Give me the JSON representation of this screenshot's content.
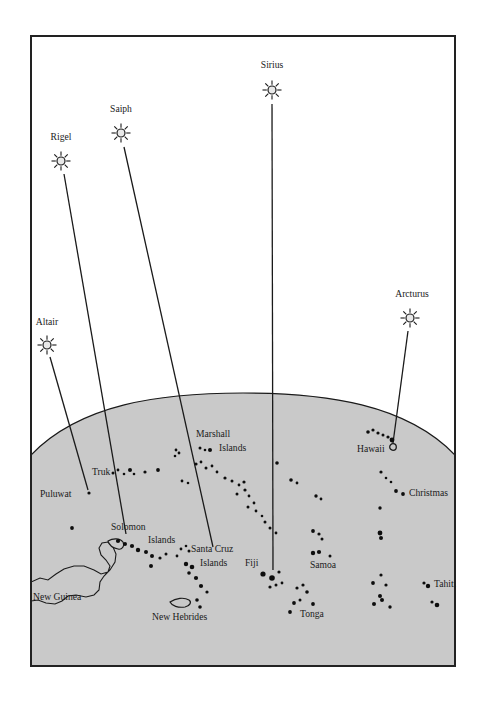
{
  "figure": {
    "frame": {
      "x": 31,
      "y": 36,
      "width": 424,
      "height": 630
    },
    "colors": {
      "ocean": "#c9c9c9",
      "sky": "#ffffff",
      "ink": "#1a1a1a",
      "frame": "#222222",
      "star_fill": "#e8e8e8",
      "page": "#ffffff"
    },
    "horizon": {
      "description": "curved ocean horizon arc",
      "left_y": 455,
      "apex_x": 243,
      "apex_y": 393,
      "right_y": 455
    }
  },
  "stars": [
    {
      "name": "Altair",
      "label": "Altair",
      "star_x": 47,
      "star_y": 345,
      "label_x": 47,
      "label_y": 325,
      "ray_line": {
        "x1": 50,
        "y1": 357,
        "x2": 88,
        "y2": 490
      }
    },
    {
      "name": "Rigel",
      "label": "Rigel",
      "star_x": 61,
      "star_y": 161,
      "label_x": 61,
      "label_y": 140,
      "ray_line": {
        "x1": 64,
        "y1": 174,
        "x2": 126,
        "y2": 534
      }
    },
    {
      "name": "Saipn",
      "label": "Saiph",
      "star_x": 121,
      "star_y": 133,
      "label_x": 121,
      "label_y": 112,
      "ray_line": {
        "x1": 124,
        "y1": 147,
        "x2": 213,
        "y2": 547
      }
    },
    {
      "name": "Sirius",
      "label": "Sirius",
      "star_x": 272,
      "star_y": 90,
      "label_x": 272,
      "label_y": 68,
      "ray_line": {
        "x1": 272,
        "y1": 104,
        "x2": 273,
        "y2": 570
      }
    },
    {
      "name": "Arcturus",
      "label": "Arcturus",
      "star_x": 410,
      "star_y": 318,
      "label_x": 412,
      "label_y": 297,
      "ray_line": {
        "x1": 408,
        "y1": 331,
        "x2": 393,
        "y2": 443
      }
    }
  ],
  "place_labels": [
    {
      "name": "puluwat",
      "label": "Puluwat",
      "x": 40,
      "y": 497,
      "anchor": "start"
    },
    {
      "name": "truk",
      "label": "Truk",
      "x": 92,
      "y": 475,
      "anchor": "start"
    },
    {
      "name": "new-guinea",
      "label": "New Guinea",
      "x": 33,
      "y": 600,
      "anchor": "start"
    },
    {
      "name": "solomon",
      "label": "Solomon",
      "x": 111,
      "y": 530,
      "anchor": "start"
    },
    {
      "name": "solomon-islands-2",
      "label": "Islands",
      "x": 148,
      "y": 543,
      "anchor": "start"
    },
    {
      "name": "marshall",
      "label": "Marshall",
      "x": 196,
      "y": 437,
      "anchor": "start"
    },
    {
      "name": "marshall-islands-2",
      "label": "Islands",
      "x": 219,
      "y": 451,
      "anchor": "start"
    },
    {
      "name": "santa-cruz",
      "label": "Santa Cruz",
      "x": 191,
      "y": 552,
      "anchor": "start"
    },
    {
      "name": "santa-cruz-islands-2",
      "label": "Islands",
      "x": 200,
      "y": 566,
      "anchor": "start"
    },
    {
      "name": "new-hebrides",
      "label": "New Hebrides",
      "x": 152,
      "y": 620,
      "anchor": "start"
    },
    {
      "name": "fiji",
      "label": "Fiji",
      "x": 245,
      "y": 566,
      "anchor": "start"
    },
    {
      "name": "tonga",
      "label": "Tonga",
      "x": 300,
      "y": 617,
      "anchor": "start"
    },
    {
      "name": "samoa",
      "label": "Samoa",
      "x": 310,
      "y": 568,
      "anchor": "start"
    },
    {
      "name": "hawaii",
      "label": "Hawaii",
      "x": 357,
      "y": 452,
      "anchor": "start"
    },
    {
      "name": "christmas",
      "label": "Christmas",
      "x": 409,
      "y": 496,
      "anchor": "start"
    },
    {
      "name": "tahiti",
      "label": "Tahiti",
      "x": 434,
      "y": 587,
      "anchor": "start"
    }
  ],
  "chart_data": {
    "type": "map",
    "legend": [],
    "island_dots": [
      {
        "group": "puluwat",
        "x": 89,
        "y": 493,
        "r": 1.6
      },
      {
        "group": "truk",
        "x": 113,
        "y": 473,
        "r": 1.5
      },
      {
        "group": "truk",
        "x": 118,
        "y": 470,
        "r": 1.4
      },
      {
        "group": "truk",
        "x": 124,
        "y": 474,
        "r": 1.3
      },
      {
        "group": "truk",
        "x": 130,
        "y": 470,
        "r": 2.0
      },
      {
        "group": "truk",
        "x": 134,
        "y": 474,
        "r": 1.3
      },
      {
        "group": "truk",
        "x": 145,
        "y": 472,
        "r": 1.6
      },
      {
        "group": "truk",
        "x": 158,
        "y": 470,
        "r": 1.9
      },
      {
        "group": "marshall",
        "x": 176,
        "y": 450,
        "r": 1.4
      },
      {
        "group": "marshall",
        "x": 179,
        "y": 453,
        "r": 1.4
      },
      {
        "group": "marshall",
        "x": 175,
        "y": 456,
        "r": 1.3
      },
      {
        "group": "marshall",
        "x": 200,
        "y": 448,
        "r": 1.5
      },
      {
        "group": "marshall",
        "x": 205,
        "y": 450,
        "r": 1.3
      },
      {
        "group": "marshall",
        "x": 210,
        "y": 450,
        "r": 2.0
      },
      {
        "group": "marshall",
        "x": 196,
        "y": 464,
        "r": 1.6
      },
      {
        "group": "marshall",
        "x": 201,
        "y": 462,
        "r": 1.4
      },
      {
        "group": "marshall",
        "x": 206,
        "y": 468,
        "r": 1.5
      },
      {
        "group": "marshall",
        "x": 212,
        "y": 466,
        "r": 1.4
      },
      {
        "group": "marshall",
        "x": 217,
        "y": 472,
        "r": 1.4
      },
      {
        "group": "marshall",
        "x": 225,
        "y": 478,
        "r": 1.6
      },
      {
        "group": "marshall",
        "x": 232,
        "y": 481,
        "r": 1.5
      },
      {
        "group": "marshall",
        "x": 239,
        "y": 485,
        "r": 1.4
      },
      {
        "group": "marshall",
        "x": 244,
        "y": 482,
        "r": 1.6
      },
      {
        "group": "gilberts",
        "x": 237,
        "y": 494,
        "r": 1.5
      },
      {
        "group": "gilberts",
        "x": 245,
        "y": 490,
        "r": 1.6
      },
      {
        "group": "gilberts",
        "x": 249,
        "y": 496,
        "r": 1.4
      },
      {
        "group": "gilberts",
        "x": 182,
        "y": 481,
        "r": 1.4
      },
      {
        "group": "gilberts",
        "x": 188,
        "y": 483,
        "r": 1.3
      },
      {
        "group": "ellice",
        "x": 248,
        "y": 507,
        "r": 1.5
      },
      {
        "group": "ellice",
        "x": 254,
        "y": 503,
        "r": 1.4
      },
      {
        "group": "ellice",
        "x": 256,
        "y": 511,
        "r": 1.4
      },
      {
        "group": "ellice",
        "x": 262,
        "y": 516,
        "r": 1.3
      },
      {
        "group": "ellice",
        "x": 265,
        "y": 522,
        "r": 1.5
      },
      {
        "group": "ellice",
        "x": 270,
        "y": 528,
        "r": 1.5
      },
      {
        "group": "ellice",
        "x": 276,
        "y": 533,
        "r": 1.4
      },
      {
        "group": "phoenix",
        "x": 277,
        "y": 463,
        "r": 1.8
      },
      {
        "group": "phoenix",
        "x": 291,
        "y": 480,
        "r": 1.8
      },
      {
        "group": "phoenix",
        "x": 297,
        "y": 483,
        "r": 1.4
      },
      {
        "group": "phoenix",
        "x": 316,
        "y": 496,
        "r": 1.7
      },
      {
        "group": "phoenix",
        "x": 321,
        "y": 499,
        "r": 1.4
      },
      {
        "group": "samoa",
        "x": 313,
        "y": 531,
        "r": 1.9
      },
      {
        "group": "samoa",
        "x": 319,
        "y": 534,
        "r": 1.6
      },
      {
        "group": "samoa",
        "x": 322,
        "y": 539,
        "r": 1.5
      },
      {
        "group": "samoa",
        "x": 313,
        "y": 553,
        "r": 2.2
      },
      {
        "group": "samoa",
        "x": 319,
        "y": 552,
        "r": 2.1
      },
      {
        "group": "samoa",
        "x": 330,
        "y": 556,
        "r": 1.5
      },
      {
        "group": "tonga",
        "x": 297,
        "y": 588,
        "r": 1.6
      },
      {
        "group": "tonga",
        "x": 303,
        "y": 585,
        "r": 1.6
      },
      {
        "group": "tonga",
        "x": 307,
        "y": 592,
        "r": 1.8
      },
      {
        "group": "tonga",
        "x": 294,
        "y": 603,
        "r": 1.9
      },
      {
        "group": "tonga",
        "x": 300,
        "y": 600,
        "r": 1.5
      },
      {
        "group": "tonga",
        "x": 290,
        "y": 612,
        "r": 1.9
      },
      {
        "group": "tonga",
        "x": 313,
        "y": 604,
        "r": 1.9
      },
      {
        "group": "hawaii",
        "x": 368,
        "y": 432,
        "r": 1.8
      },
      {
        "group": "hawaii",
        "x": 373,
        "y": 430,
        "r": 1.6
      },
      {
        "group": "hawaii",
        "x": 378,
        "y": 433,
        "r": 1.6
      },
      {
        "group": "hawaii",
        "x": 383,
        "y": 435,
        "r": 1.5
      },
      {
        "group": "hawaii",
        "x": 388,
        "y": 437,
        "r": 1.6
      },
      {
        "group": "hawaii",
        "x": 392,
        "y": 440,
        "r": 2.4
      },
      {
        "group": "line-is",
        "x": 381,
        "y": 472,
        "r": 1.6
      },
      {
        "group": "line-is",
        "x": 386,
        "y": 478,
        "r": 1.3
      },
      {
        "group": "line-is",
        "x": 391,
        "y": 482,
        "r": 1.3
      },
      {
        "group": "line-is",
        "x": 396,
        "y": 491,
        "r": 1.9
      },
      {
        "group": "line-is",
        "x": 403,
        "y": 494,
        "r": 1.9
      },
      {
        "group": "line-is",
        "x": 380,
        "y": 508,
        "r": 1.7
      },
      {
        "group": "cooks",
        "x": 380,
        "y": 533,
        "r": 2.4
      },
      {
        "group": "cooks",
        "x": 381,
        "y": 538,
        "r": 2.0
      },
      {
        "group": "cooks",
        "x": 381,
        "y": 575,
        "r": 1.6
      },
      {
        "group": "cooks",
        "x": 373,
        "y": 583,
        "r": 1.9
      },
      {
        "group": "cooks",
        "x": 386,
        "y": 585,
        "r": 1.6
      },
      {
        "group": "cooks",
        "x": 380,
        "y": 596,
        "r": 2.0
      },
      {
        "group": "cooks",
        "x": 382,
        "y": 600,
        "r": 2.0
      },
      {
        "group": "cooks",
        "x": 374,
        "y": 604,
        "r": 2.0
      },
      {
        "group": "cooks",
        "x": 390,
        "y": 607,
        "r": 1.7
      },
      {
        "group": "tahiti",
        "x": 424,
        "y": 583,
        "r": 1.6
      },
      {
        "group": "tahiti",
        "x": 428,
        "y": 586,
        "r": 2.2
      },
      {
        "group": "tahiti",
        "x": 432,
        "y": 602,
        "r": 1.6
      },
      {
        "group": "tahiti",
        "x": 437,
        "y": 605,
        "r": 2.3
      },
      {
        "group": "santa-cruz",
        "x": 181,
        "y": 549,
        "r": 1.4
      },
      {
        "group": "santa-cruz",
        "x": 186,
        "y": 546,
        "r": 1.3
      },
      {
        "group": "santa-cruz",
        "x": 189,
        "y": 551,
        "r": 1.5
      },
      {
        "group": "santa-cruz",
        "x": 177,
        "y": 556,
        "r": 1.4
      },
      {
        "group": "santa-cruz",
        "x": 186,
        "y": 564,
        "r": 2.2
      },
      {
        "group": "santa-cruz",
        "x": 192,
        "y": 567,
        "r": 2.3
      },
      {
        "group": "santa-cruz",
        "x": 189,
        "y": 573,
        "r": 1.8
      },
      {
        "group": "santa-cruz",
        "x": 196,
        "y": 578,
        "r": 2.1
      },
      {
        "group": "santa-cruz",
        "x": 201,
        "y": 586,
        "r": 2.1
      },
      {
        "group": "santa-cruz",
        "x": 207,
        "y": 592,
        "r": 1.6
      },
      {
        "group": "new-hebrides",
        "x": 197,
        "y": 600,
        "r": 1.8
      },
      {
        "group": "new-hebrides",
        "x": 200,
        "y": 607,
        "r": 1.8
      },
      {
        "group": "fiji",
        "x": 263,
        "y": 574,
        "r": 2.6
      },
      {
        "group": "fiji",
        "x": 272,
        "y": 578,
        "r": 2.8
      },
      {
        "group": "fiji",
        "x": 279,
        "y": 572,
        "r": 1.6
      },
      {
        "group": "fiji",
        "x": 276,
        "y": 585,
        "r": 1.5
      },
      {
        "group": "fiji",
        "x": 282,
        "y": 583,
        "r": 1.4
      },
      {
        "group": "fiji",
        "x": 270,
        "y": 587,
        "r": 1.6
      },
      {
        "group": "solomon",
        "x": 72,
        "y": 528,
        "r": 1.9
      },
      {
        "group": "solomon",
        "x": 118,
        "y": 541,
        "r": 2.1
      },
      {
        "group": "solomon",
        "x": 125,
        "y": 544,
        "r": 2.0
      },
      {
        "group": "solomon",
        "x": 132,
        "y": 546,
        "r": 2.1
      },
      {
        "group": "solomon",
        "x": 138,
        "y": 550,
        "r": 2.2
      },
      {
        "group": "solomon",
        "x": 146,
        "y": 552,
        "r": 2.0
      },
      {
        "group": "solomon",
        "x": 152,
        "y": 556,
        "r": 2.0
      },
      {
        "group": "solomon",
        "x": 160,
        "y": 558,
        "r": 1.6
      },
      {
        "group": "solomon",
        "x": 151,
        "y": 566,
        "r": 2.0
      },
      {
        "group": "solomon",
        "x": 166,
        "y": 554,
        "r": 1.5
      }
    ]
  }
}
